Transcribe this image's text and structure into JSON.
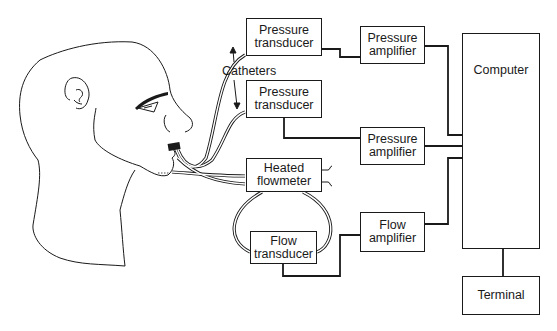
{
  "diagram": {
    "boxes": {
      "pressure_transducer_1": "Pressure\ntransducer",
      "pressure_transducer_2": "Pressure\ntransducer",
      "pressure_amplifier_1": "Pressure\namplifier",
      "pressure_amplifier_2": "Pressure\namplifier",
      "heated_flowmeter": "Heated\nflowmeter",
      "flow_transducer": "Flow\ntransducer",
      "flow_amplifier": "Flow\namplifier",
      "computer": "Computer",
      "terminal": "Terminal"
    },
    "labels": {
      "catheters": "Catheters"
    },
    "colors": {
      "line": "#1a1a1a",
      "background": "#ffffff"
    }
  }
}
